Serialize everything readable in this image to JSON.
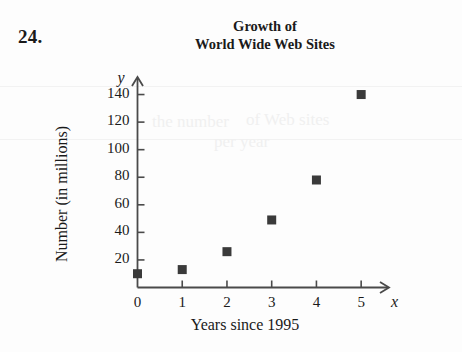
{
  "problem": {
    "number": "24."
  },
  "chart_data": {
    "type": "scatter",
    "title": "Growth of\nWorld Wide Web Sites",
    "title_line1": "Growth of",
    "title_line2": "World Wide Web Sites",
    "xlabel": "Years since 1995",
    "ylabel": "Number (in millions)",
    "x_axis_variable": "x",
    "y_axis_variable": "y",
    "x": [
      0,
      1,
      2,
      3,
      4,
      5
    ],
    "values": [
      10,
      13,
      26,
      49,
      78,
      140
    ],
    "points": [
      {
        "x": 0,
        "y": 10
      },
      {
        "x": 1,
        "y": 13
      },
      {
        "x": 2,
        "y": 26
      },
      {
        "x": 3,
        "y": 49
      },
      {
        "x": 4,
        "y": 78
      },
      {
        "x": 5,
        "y": 140
      }
    ],
    "xlim": [
      0,
      5.6
    ],
    "ylim": [
      0,
      152
    ],
    "x_ticks": [
      "0",
      "1",
      "2",
      "3",
      "4",
      "5"
    ],
    "y_ticks": [
      "20",
      "40",
      "60",
      "80",
      "100",
      "120",
      "140"
    ],
    "grid": false,
    "legend": null,
    "marker": "square",
    "marker_color": "#3a3a3a",
    "axis_color": "#4a4a4a"
  },
  "ghost_text": {
    "line1": "the number",
    "line2": "of Web sites",
    "line3": "per year"
  }
}
